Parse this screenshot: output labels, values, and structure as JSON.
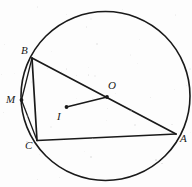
{
  "figure": {
    "canvas": {
      "width": 192,
      "height": 187
    },
    "background_color": "#fdfdfd",
    "stroke_color": "#1a1a1a",
    "label_color": "#1a1a1a",
    "circle": {
      "name": "circumscribed-circle",
      "cx": 105.5,
      "cy": 96,
      "r": 84.5,
      "stroke_width": 1.6
    },
    "points": [
      {
        "id": "B",
        "label": "B",
        "x": 32,
        "y": 58,
        "label_x": 21,
        "label_y": 45,
        "dot": false
      },
      {
        "id": "M",
        "label": "M",
        "x": 21.5,
        "y": 100,
        "label_x": 6,
        "label_y": 94,
        "dot": true
      },
      {
        "id": "C",
        "label": "C",
        "x": 37,
        "y": 140.5,
        "label_x": 25,
        "label_y": 140,
        "dot": false
      },
      {
        "id": "A",
        "label": "A",
        "x": 176,
        "y": 134,
        "label_x": 180,
        "label_y": 133,
        "dot": false
      },
      {
        "id": "O",
        "label": "O",
        "x": 107,
        "y": 97,
        "label_x": 108,
        "label_y": 80,
        "dot": true
      },
      {
        "id": "I",
        "label": "I",
        "x": 66.5,
        "y": 107,
        "label_x": 57,
        "label_y": 111,
        "dot": true
      }
    ],
    "segments": [
      {
        "name": "segment-BA",
        "from": "B",
        "to": "A",
        "stroke_width": 1.7
      },
      {
        "name": "segment-BC",
        "from": "B",
        "to": "C",
        "stroke_width": 1.7
      },
      {
        "name": "segment-CA",
        "from": "C",
        "to": "A",
        "stroke_width": 1.7
      },
      {
        "name": "segment-BM",
        "from": "B",
        "to": "M",
        "stroke_width": 1.3
      },
      {
        "name": "segment-MC",
        "from": "M",
        "to": "C",
        "stroke_width": 1.3
      },
      {
        "name": "segment-IO",
        "from": "I",
        "to": "O",
        "stroke_width": 1.7
      }
    ],
    "dot_radius": 1.9
  }
}
